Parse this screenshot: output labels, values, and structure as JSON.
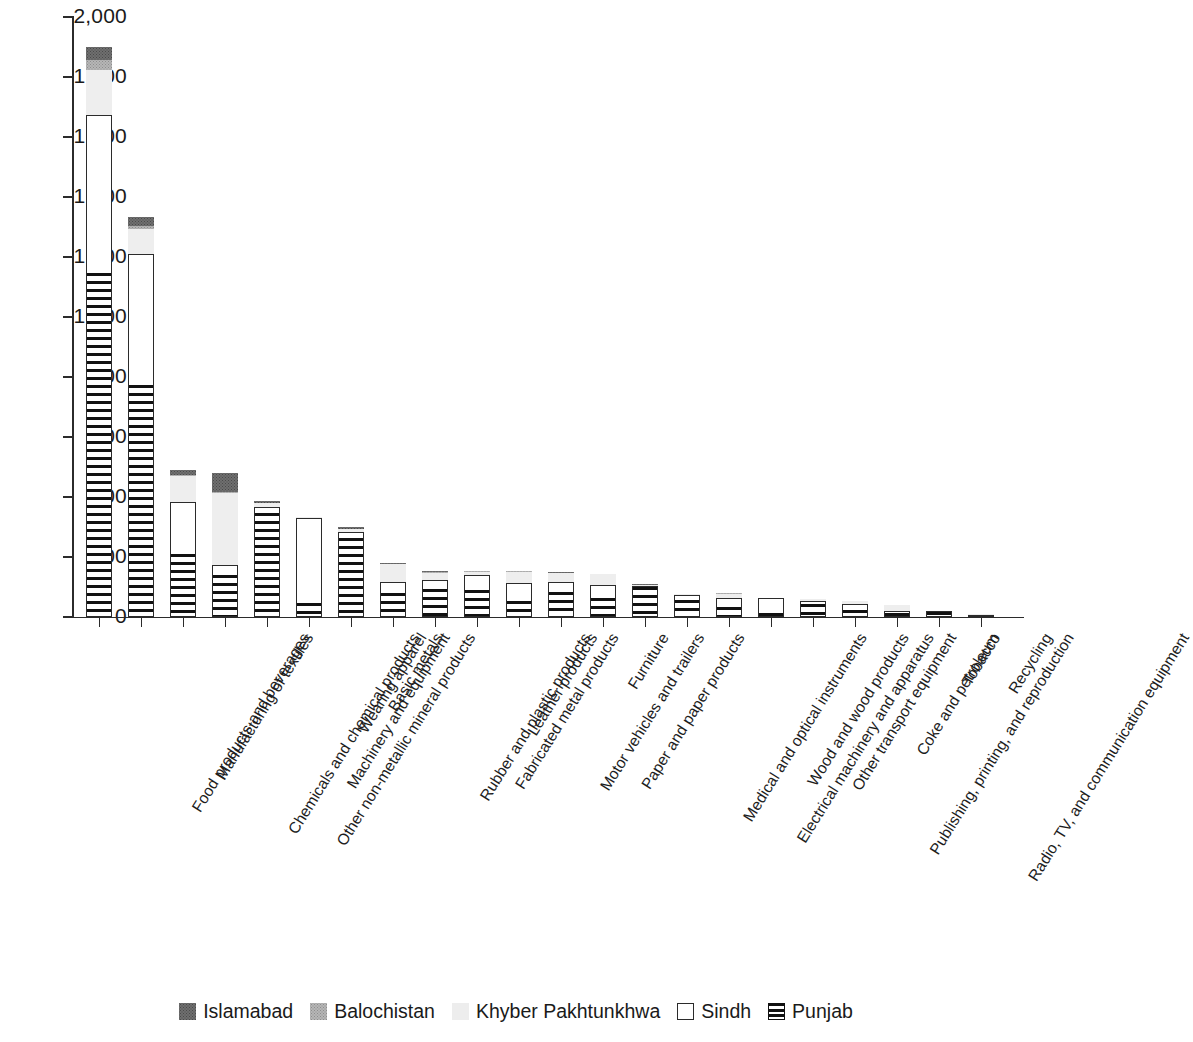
{
  "chart_data": {
    "type": "bar",
    "subtype": "stacked-vertical",
    "title": "",
    "xlabel": "",
    "ylabel": "",
    "ylim": [
      0,
      2000
    ],
    "yticks": [
      "0",
      "200",
      "400",
      "600",
      "800",
      "1,000",
      "1,200",
      "1,400",
      "1,600",
      "1,800",
      "2,000"
    ],
    "ytick_values": [
      0,
      200,
      400,
      600,
      800,
      1000,
      1200,
      1400,
      1600,
      1800,
      2000
    ],
    "grid": false,
    "legend_position": "bottom",
    "legend": [
      "Islamabad",
      "Balochistan",
      "Khyber Pakhtunkhwa",
      "Sindh",
      "Punjab"
    ],
    "categories": [
      "Food products and beverages",
      "Manufacturing of textiles",
      "Chemicals and chemical products",
      "Other non-metallic mineral products",
      "Machinery and equipment",
      "Wearing apparel",
      "Basic metals",
      "Rubber and plastic products",
      "Fabricated metal products",
      "Leather products",
      "Motor vehicles and trailers",
      "Paper and paper products",
      "Furniture",
      "Medical and optical instruments",
      "Electrical machinery and apparatus",
      "Wood and wood products",
      "Other transport equipment",
      "Publishing, printing, and reproduction",
      "Coke and petroleum",
      "Radio, TV, and communication equipment",
      "Tobacco",
      "Recycling"
    ],
    "series": [
      {
        "name": "Punjab",
        "color": "#111111",
        "pattern": "horizontal-stripes",
        "values": [
          1147,
          773,
          210,
          140,
          347,
          47,
          263,
          80,
          95,
          90,
          52,
          83,
          65,
          100,
          58,
          35,
          15,
          45,
          22,
          12,
          18,
          5
        ]
      },
      {
        "name": "Sindh",
        "color": "#ffffff",
        "pattern": "outline",
        "values": [
          527,
          437,
          172,
          33,
          20,
          283,
          22,
          38,
          28,
          50,
          60,
          35,
          42,
          5,
          15,
          30,
          48,
          7,
          22,
          7,
          2,
          3
        ]
      },
      {
        "name": "Khyber Pakhtunkhwa",
        "color": "#ededed",
        "pattern": "fine-dots",
        "values": [
          150,
          85,
          88,
          240,
          12,
          2,
          7,
          58,
          25,
          10,
          38,
          28,
          35,
          3,
          5,
          12,
          2,
          8,
          8,
          22,
          1,
          2
        ]
      },
      {
        "name": "Balochistan",
        "color": "#b6b6b6",
        "pattern": "medium-dots",
        "values": [
          33,
          10,
          5,
          5,
          2,
          0,
          2,
          2,
          2,
          2,
          2,
          2,
          1,
          0,
          1,
          2,
          0,
          1,
          0,
          1,
          0,
          0
        ]
      },
      {
        "name": "Islamabad",
        "color": "#6f6f6f",
        "pattern": "dark-dots",
        "values": [
          43,
          28,
          15,
          62,
          5,
          0,
          5,
          2,
          2,
          2,
          2,
          2,
          1,
          2,
          1,
          1,
          0,
          1,
          1,
          1,
          0,
          0
        ]
      }
    ],
    "totals": [
      1900,
      1333,
      490,
      480,
      386,
      332,
      299,
      180,
      152,
      154,
      154,
      150,
      144,
      110,
      80,
      80,
      65,
      62,
      53,
      43,
      21,
      10
    ]
  }
}
